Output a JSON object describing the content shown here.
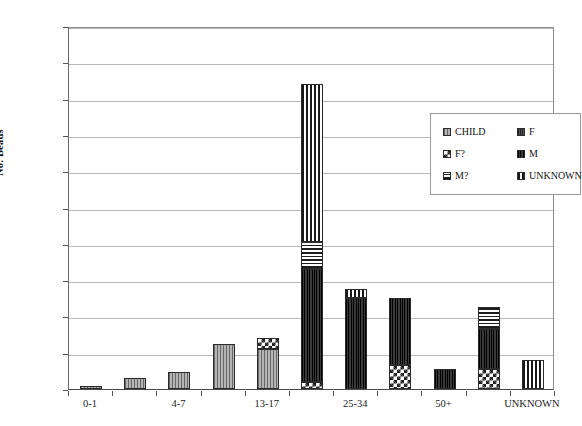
{
  "chart_data": {
    "type": "bar",
    "subtype": "stacked-bar",
    "title": "",
    "xlabel": "",
    "ylabel": "No. Beads",
    "ylim": [
      0,
      1000
    ],
    "ytick_step": 100,
    "yticks": [
      "0",
      "100",
      "200",
      "300",
      "400",
      "500",
      "600",
      "700",
      "800",
      "900",
      "1000"
    ],
    "grid": "horizontal",
    "legend_position": "inside-upper-right",
    "categories": [
      "0-1",
      "2-3",
      "4-7",
      "8-12",
      "13-17",
      "18-24",
      "25-34",
      "35-49",
      "50+",
      "60+",
      "UNKNOWN"
    ],
    "visible_tick_labels": [
      "0-1",
      "4-7",
      "13-17",
      "25-34",
      "50+",
      "UNKNOWN"
    ],
    "series": [
      {
        "name": "CHILD",
        "pattern": "light-gray-vertical-hatch",
        "values": [
          8,
          30,
          46,
          125,
          110,
          0,
          0,
          0,
          0,
          0,
          0
        ]
      },
      {
        "name": "F?",
        "pattern": "checkerboard",
        "values": [
          0,
          0,
          0,
          0,
          30,
          20,
          0,
          65,
          0,
          55,
          0
        ]
      },
      {
        "name": "M?",
        "pattern": "horizontal-stripes",
        "values": [
          0,
          0,
          0,
          0,
          0,
          75,
          0,
          0,
          0,
          60,
          0
        ]
      },
      {
        "name": "F",
        "pattern": "dark-gray-fine-vertical",
        "values": [
          0,
          0,
          0,
          0,
          0,
          0,
          0,
          0,
          0,
          0,
          0
        ]
      },
      {
        "name": "M",
        "pattern": "solid-dark",
        "values": [
          0,
          0,
          0,
          0,
          0,
          310,
          250,
          185,
          55,
          110,
          0
        ]
      },
      {
        "name": "UNKNOWN",
        "pattern": "vertical-stripes",
        "values": [
          0,
          0,
          0,
          0,
          0,
          435,
          25,
          0,
          0,
          0,
          80
        ]
      }
    ],
    "totals": [
      8,
      30,
      46,
      125,
      140,
      840,
      275,
      250,
      55,
      225,
      80
    ],
    "bar_max_total": 870,
    "legend_entries": [
      {
        "label": "CHILD",
        "pattern": "light-gray-vertical-hatch"
      },
      {
        "label": "F",
        "pattern": "dark-gray-fine-vertical"
      },
      {
        "label": "F?",
        "pattern": "checkerboard"
      },
      {
        "label": "M",
        "pattern": "solid-dark"
      },
      {
        "label": "M?",
        "pattern": "horizontal-stripes"
      },
      {
        "label": "UNKNOWN",
        "pattern": "vertical-stripes"
      }
    ],
    "colors": {
      "child": "#b4b4b4",
      "f": "#4c4c4c",
      "m": "#262626",
      "outline": "#2b2b2b",
      "gridline": "#b9b9b9",
      "axis": "#4a4a4a",
      "background": "#ffffff"
    }
  }
}
